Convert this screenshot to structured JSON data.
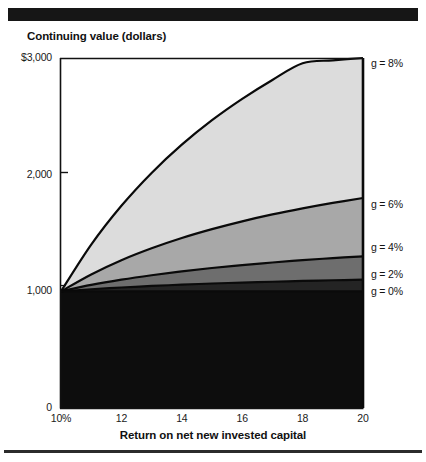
{
  "figure": {
    "y_axis_title": "Continuing value (dollars)",
    "x_axis_title": "Return on net new invested capital",
    "rule_color": "#161616"
  },
  "axes": {
    "y_ticks": [
      {
        "label": "$3,000",
        "value": 3000
      },
      {
        "label": "2,000",
        "value": 2000
      },
      {
        "label": "1,000",
        "value": 1000
      },
      {
        "label": "0",
        "value": 0
      }
    ],
    "x_ticks": [
      {
        "label": "10%",
        "value": 10
      },
      {
        "label": "12",
        "value": 12
      },
      {
        "label": "14",
        "value": 14
      },
      {
        "label": "16",
        "value": 16
      },
      {
        "label": "18",
        "value": 18
      },
      {
        "label": "20",
        "value": 20
      }
    ]
  },
  "legend": [
    {
      "label": "g = 8%",
      "y": 57
    },
    {
      "label": "g = 6%",
      "y": 198
    },
    {
      "label": "g = 4%",
      "y": 241
    },
    {
      "label": "g = 2%",
      "y": 268
    },
    {
      "label": "g = 0%",
      "y": 285
    }
  ],
  "chart_data": {
    "type": "area",
    "title": "",
    "subtitle": "",
    "xlabel": "Return on net new invested capital",
    "ylabel": "Continuing value (dollars)",
    "xlim": [
      10,
      20
    ],
    "ylim": [
      0,
      3000
    ],
    "grid": false,
    "legend_position": "right",
    "stacked": false,
    "x": [
      10,
      11,
      12,
      13,
      14,
      15,
      16,
      17,
      18,
      19,
      20
    ],
    "series": [
      {
        "name": "g = 0%",
        "fill": "#0d0d0d",
        "values": [
          1000,
          1000,
          1000,
          1000,
          1000,
          1000,
          1000,
          1000,
          1000,
          1000,
          1000
        ]
      },
      {
        "name": "g = 2%",
        "fill": "#242424",
        "values": [
          1000,
          1018,
          1033,
          1046,
          1057,
          1067,
          1075,
          1082,
          1089,
          1095,
          1100
        ]
      },
      {
        "name": "g = 4%",
        "fill": "#6e6e6e",
        "values": [
          1000,
          1055,
          1100,
          1138,
          1171,
          1200,
          1225,
          1247,
          1267,
          1285,
          1300
        ]
      },
      {
        "name": "g = 6%",
        "fill": "#a8a8a8",
        "values": [
          1000,
          1145,
          1267,
          1369,
          1457,
          1533,
          1600,
          1659,
          1711,
          1758,
          1800
        ]
      },
      {
        "name": "g = 8%",
        "fill": "#dcdcdc",
        "values": [
          1000,
          1400,
          1733,
          2015,
          2257,
          2467,
          2650,
          2812,
          2955,
          2980,
          3000
        ]
      }
    ]
  }
}
